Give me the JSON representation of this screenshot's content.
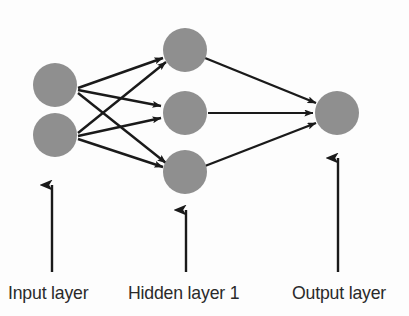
{
  "diagram": {
    "type": "neural-network-architecture",
    "title": "",
    "background_color": "#fdfdfd",
    "node_fill_color": "#8f8f8f",
    "node_stroke_color": "#8f8f8f",
    "edge_color": "#1a1a1a",
    "label_color": "#2a2a2a",
    "node_radius": 22
  },
  "labels": {
    "input": "Input layer",
    "hidden": "Hidden layer 1",
    "output": "Output layer"
  },
  "layers": [
    {
      "id": "input",
      "name": "Input layer",
      "node_count": 2,
      "nodes": [
        {
          "id": "i1",
          "cx": 55,
          "cy": 85,
          "r": 22
        },
        {
          "id": "i2",
          "cx": 55,
          "cy": 135,
          "r": 22
        }
      ],
      "pointer_arrow": {
        "x": 52,
        "y_start": 272,
        "y_end": 185
      }
    },
    {
      "id": "hidden1",
      "name": "Hidden layer 1",
      "node_count": 3,
      "nodes": [
        {
          "id": "h1",
          "cx": 185,
          "cy": 50,
          "r": 22
        },
        {
          "id": "h2",
          "cx": 185,
          "cy": 113,
          "r": 22
        },
        {
          "id": "h3",
          "cx": 185,
          "cy": 172,
          "r": 22
        }
      ],
      "pointer_arrow": {
        "x": 186,
        "y_start": 272,
        "y_end": 210
      }
    },
    {
      "id": "output",
      "name": "Output layer",
      "node_count": 1,
      "nodes": [
        {
          "id": "o1",
          "cx": 337,
          "cy": 113,
          "r": 22
        }
      ],
      "pointer_arrow": {
        "x": 338,
        "y_start": 272,
        "y_end": 158
      }
    }
  ],
  "connections": [
    {
      "from": "i1",
      "to": "h1",
      "x1": 78,
      "y1": 88,
      "x2": 163,
      "y2": 58
    },
    {
      "from": "i1",
      "to": "h2",
      "x1": 78,
      "y1": 90,
      "x2": 161,
      "y2": 106
    },
    {
      "from": "i1",
      "to": "h3",
      "x1": 78,
      "y1": 93,
      "x2": 166,
      "y2": 163
    },
    {
      "from": "i2",
      "to": "h1",
      "x1": 78,
      "y1": 133,
      "x2": 166,
      "y2": 62
    },
    {
      "from": "i2",
      "to": "h2",
      "x1": 78,
      "y1": 136,
      "x2": 161,
      "y2": 118
    },
    {
      "from": "i2",
      "to": "h3",
      "x1": 78,
      "y1": 139,
      "x2": 163,
      "y2": 167
    },
    {
      "from": "h1",
      "to": "o1",
      "x1": 205,
      "y1": 58,
      "x2": 316,
      "y2": 103
    },
    {
      "from": "h2",
      "to": "o1",
      "x1": 208,
      "y1": 113,
      "x2": 313,
      "y2": 113
    },
    {
      "from": "h3",
      "to": "o1",
      "x1": 205,
      "y1": 166,
      "x2": 316,
      "y2": 123
    }
  ]
}
